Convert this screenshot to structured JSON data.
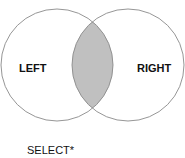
{
  "diagram": {
    "type": "venn",
    "circles": [
      {
        "name": "left",
        "label": "LEFT"
      },
      {
        "name": "right",
        "label": "RIGHT"
      }
    ],
    "highlight": "intersection",
    "colors": {
      "stroke": "#8a8a8a",
      "fill": "#c0c0c0",
      "background": "#ffffff"
    },
    "caption": "SELECT*"
  }
}
